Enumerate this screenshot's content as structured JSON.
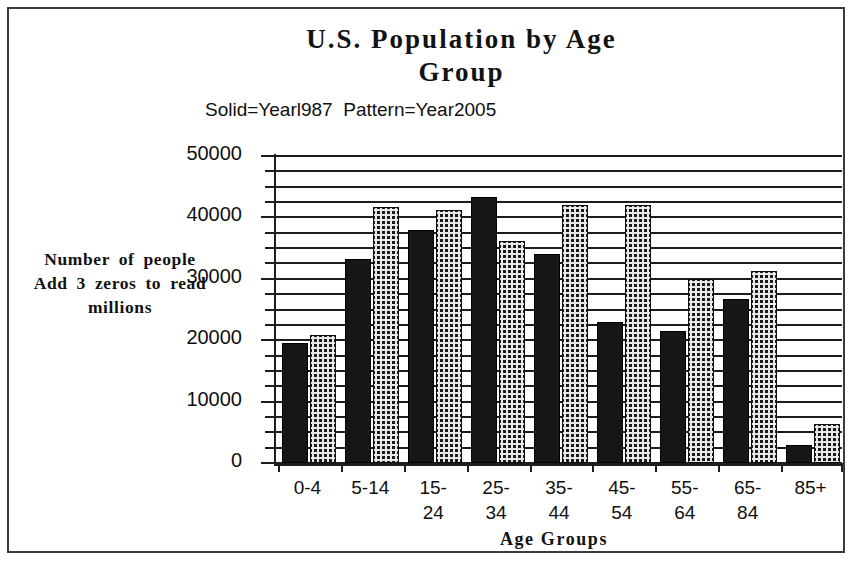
{
  "chart_data": {
    "type": "bar",
    "title": "U.S. Population by Age\nGroup",
    "subtitle": "Solid=Yearl987  Pattern=Year2005",
    "xlabel": "Age Groups",
    "ylabel": "Number of people Add 3 zeros to read millions",
    "categories": [
      "0-4",
      "5-14",
      "15-\n24",
      "25-\n34",
      "35-\n44",
      "45-\n54",
      "55-\n64",
      "65-\n84",
      "85+"
    ],
    "category_values": [
      "0-4",
      "5-14",
      "15-24",
      "25-34",
      "35-44",
      "45-54",
      "55-64",
      "65-84",
      "85+"
    ],
    "series": [
      {
        "name": "Solid=Yearl987",
        "pattern": "solid",
        "values": [
          19500,
          33200,
          38000,
          43300,
          34000,
          23000,
          21500,
          26700,
          3000
        ]
      },
      {
        "name": "Pattern=Year2005",
        "pattern": "checker",
        "values": [
          20800,
          41700,
          41200,
          36100,
          42000,
          42000,
          29900,
          31300,
          6300
        ]
      }
    ],
    "ylim": [
      0,
      50000
    ],
    "ytick_labels": [
      "0",
      "10000",
      "20000",
      "30000",
      "40000",
      "50000"
    ],
    "ytick_values": [
      0,
      10000,
      20000,
      30000,
      40000,
      50000
    ],
    "minor_tick_step": 2500,
    "grid": true,
    "grid_axis": "y",
    "legend": "inline-subtitle",
    "legend_position": "above-plot-left",
    "colors": {
      "solid": "#161616",
      "pattern_fg": "#1a1a1a",
      "pattern_bg": "#e8e8e8",
      "axis": "#1d1d1d",
      "text": "#121212",
      "background": "#ffffff",
      "frame": "#3b3b3b"
    }
  }
}
